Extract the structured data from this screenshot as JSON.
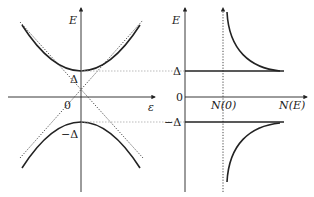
{
  "left_panel": {
    "y_axis_label": "E",
    "x_axis_label": "ε",
    "origin_label": "0",
    "gap_upper_label": "Δ",
    "gap_lower_label": "−Δ",
    "curves": [
      "upper-hyperbola-branch",
      "lower-hyperbola-branch",
      "asymptote-positive",
      "asymptote-negative"
    ]
  },
  "right_panel": {
    "y_axis_label": "E",
    "x_axis_label": "N(E)",
    "normal_dos_label": "N(0)",
    "zero_label": "0",
    "gap_upper_label": "Δ",
    "gap_lower_label": "−Δ",
    "curves": [
      "upper-dos-divergence",
      "lower-dos-divergence"
    ]
  },
  "colors": {
    "line": "#222222",
    "guide": "#999999"
  }
}
